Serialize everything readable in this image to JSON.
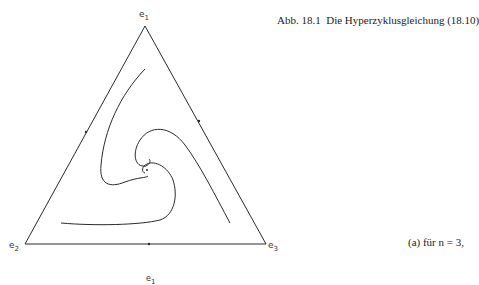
{
  "caption": {
    "figure_label": "Abb. 18.1",
    "title": "Die Hyperzyklusgleichung (18.10)",
    "subcaption": "(a) für n = 3,"
  },
  "vertices": [
    {
      "name": "e",
      "index": "1"
    },
    {
      "name": "e",
      "index": "2"
    },
    {
      "name": "e",
      "index": "3"
    }
  ],
  "next_figure_label": {
    "name": "e",
    "index": "1"
  },
  "colors": {
    "line": "#2a2a2a",
    "background": "#ffffff"
  }
}
